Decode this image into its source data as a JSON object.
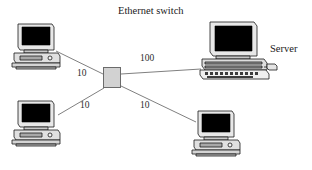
{
  "diagram": {
    "type": "network-topology",
    "title": "Ethernet switch",
    "background_color": "#ffffff",
    "line_color": "#808080",
    "ink_color": "#000000",
    "switch_fill": "#d2d2d2",
    "switch_stroke": "#6b6b6b"
  },
  "nodes": [
    {
      "id": "switch",
      "label": "Ethernet switch",
      "kind": "ethernet-switch",
      "x": 112,
      "y": 77
    },
    {
      "id": "pc1",
      "label": "",
      "kind": "desktop-computer",
      "x": 36,
      "y": 45
    },
    {
      "id": "pc2",
      "label": "",
      "kind": "desktop-computer",
      "x": 36,
      "y": 122
    },
    {
      "id": "pc3",
      "label": "",
      "kind": "desktop-computer",
      "x": 214,
      "y": 132
    },
    {
      "id": "server",
      "label": "Server",
      "kind": "server-computer",
      "x": 232,
      "y": 52
    }
  ],
  "links": [
    {
      "from": "pc1",
      "to": "switch",
      "label": "10",
      "units": "Mbps"
    },
    {
      "from": "switch",
      "to": "server",
      "label": "100",
      "units": "Mbps"
    },
    {
      "from": "pc2",
      "to": "switch",
      "label": "10",
      "units": "Mbps"
    },
    {
      "from": "switch",
      "to": "pc3",
      "label": "10",
      "units": "Mbps"
    }
  ],
  "labels": {
    "title": "Ethernet switch",
    "server": "Server"
  }
}
